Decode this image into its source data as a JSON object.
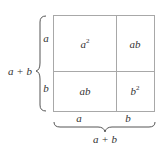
{
  "diagram": {
    "colors": {
      "line": "#a8a8a8",
      "text": "#333333",
      "brace": "#555555"
    },
    "left_label": "a + b",
    "bottom_label": "a + b",
    "row_labels": [
      "a",
      "b"
    ],
    "col_labels": [
      "a",
      "b"
    ],
    "cells": [
      {
        "base": "a",
        "exp": "2",
        "position": "top-left"
      },
      {
        "base": "ab",
        "exp": "",
        "position": "top-right"
      },
      {
        "base": "ab",
        "exp": "",
        "position": "bottom-left"
      },
      {
        "base": "b",
        "exp": "2",
        "position": "bottom-right"
      }
    ]
  }
}
